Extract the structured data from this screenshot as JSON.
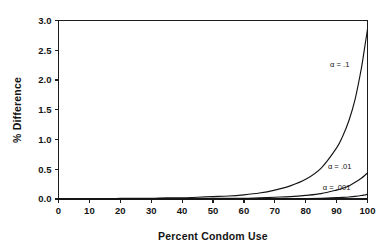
{
  "chart_data": {
    "type": "line",
    "title": "",
    "xlabel": "Percent Condom Use",
    "ylabel": "% Difference",
    "xlim": [
      0,
      100
    ],
    "ylim": [
      0,
      3.0
    ],
    "xticks": [
      0,
      10,
      20,
      30,
      40,
      50,
      60,
      70,
      80,
      90,
      100
    ],
    "xtick_labels": [
      "0",
      "10",
      "20",
      "30",
      "40",
      "50",
      "60",
      "70",
      "80",
      "90",
      "100"
    ],
    "yticks": [
      0.0,
      0.5,
      1.0,
      1.5,
      2.0,
      2.5,
      3.0
    ],
    "ytick_labels": [
      "0.0",
      "0.5",
      "1.0",
      "1.5",
      "2.0",
      "2.5",
      "3.0"
    ],
    "grid": false,
    "legend_position": "inline-annotations",
    "x": [
      0,
      5,
      10,
      15,
      20,
      25,
      30,
      35,
      40,
      45,
      50,
      55,
      60,
      65,
      70,
      75,
      80,
      85,
      90,
      92,
      94,
      96,
      98,
      99,
      100
    ],
    "series": [
      {
        "name": "alpha = .1",
        "label": "α = .1",
        "label_x": 91,
        "label_y": 2.22,
        "color": "#141414",
        "values": [
          0.0,
          0.0,
          0.0,
          0.0,
          0.01,
          0.01,
          0.01,
          0.02,
          0.02,
          0.03,
          0.04,
          0.05,
          0.07,
          0.1,
          0.15,
          0.22,
          0.33,
          0.52,
          0.86,
          1.06,
          1.32,
          1.68,
          2.19,
          2.52,
          2.85
        ]
      },
      {
        "name": "alpha = .01",
        "label": "α = .01",
        "label_x": 91,
        "label_y": 0.5,
        "color": "#141414",
        "values": [
          0.0,
          0.0,
          0.0,
          0.0,
          0.0,
          0.0,
          0.0,
          0.0,
          0.0,
          0.0,
          0.01,
          0.01,
          0.01,
          0.02,
          0.03,
          0.04,
          0.06,
          0.09,
          0.15,
          0.18,
          0.22,
          0.28,
          0.35,
          0.39,
          0.44
        ]
      },
      {
        "name": "alpha = .001",
        "label": "α = .001",
        "label_x": 90,
        "label_y": 0.155,
        "color": "#141414",
        "values": [
          0.0,
          0.0,
          0.0,
          0.0,
          0.0,
          0.0,
          0.0,
          0.0,
          0.0,
          0.0,
          0.0,
          0.0,
          0.0,
          0.0,
          0.0,
          0.005,
          0.008,
          0.013,
          0.022,
          0.027,
          0.034,
          0.044,
          0.058,
          0.068,
          0.08
        ]
      }
    ]
  }
}
